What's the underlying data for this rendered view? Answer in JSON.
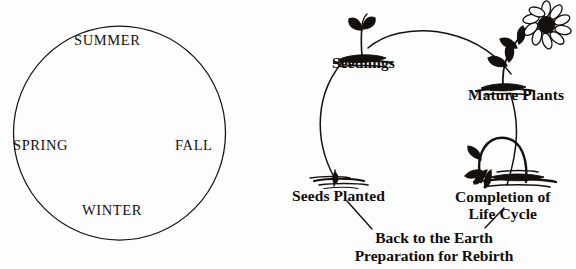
{
  "figure": {
    "background_color": "#fdfdfd",
    "ink_color": "#14100e"
  },
  "seasons": {
    "shape": "circle",
    "labels": [
      {
        "key": "summer",
        "text": "SUMMER",
        "position": "top"
      },
      {
        "key": "spring",
        "text": "SPRING",
        "position": "left"
      },
      {
        "key": "fall",
        "text": "FALL",
        "position": "right"
      },
      {
        "key": "winter",
        "text": "WINTER",
        "position": "bottom"
      }
    ]
  },
  "lifecycle": {
    "stages": [
      {
        "key": "seedlings",
        "text": "Seedlings",
        "icon": "seedling-sprout-icon"
      },
      {
        "key": "mature",
        "text": "Mature Plants",
        "icon": "flowering-plant-icon"
      },
      {
        "key": "completion",
        "line1": "Completion of",
        "line2": "Life Cycle",
        "icon": "withered-plant-icon"
      },
      {
        "key": "seeds",
        "text": "Seeds Planted",
        "icon": "seed-in-soil-icon"
      }
    ],
    "caption": {
      "line1": "Back to the Earth",
      "line2": "Preparation for Rebirth"
    }
  }
}
